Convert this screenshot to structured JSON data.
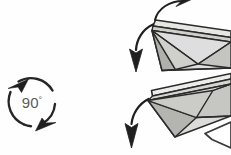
{
  "diagram": {
    "background_color": "#fefefe",
    "rotation_symbol": {
      "label": "90°",
      "degrees": 90,
      "degree_glyph": "°",
      "number": "90",
      "center_x": 32,
      "center_y": 102,
      "radius": 25,
      "stroke_color": "#262626",
      "text_color": "#5a5a5a",
      "arrow_heads": [
        {
          "name": "counterclockwise-top-arrowhead",
          "position": "top-left"
        },
        {
          "name": "counterclockwise-bottom-arrowhead",
          "position": "bottom-right"
        }
      ]
    },
    "palette": {
      "outline": "#2b2b2b",
      "facet_light": "#e8e8e6",
      "facet_mid": "#c9c9c6",
      "facet_dark": "#b2b2ae",
      "facet_white": "#fbfbfa",
      "arrow_fill": "#1f1f1f"
    },
    "upper_model": {
      "name": "upper-folded-module",
      "facet_count": 6
    },
    "lower_model": {
      "name": "lower-folded-module",
      "facet_count": 6
    },
    "arrows": [
      {
        "name": "top-curved-arrow",
        "direction": "up-right"
      },
      {
        "name": "upper-left-curved-arrow",
        "direction": "down-left"
      },
      {
        "name": "lower-left-curved-arrow",
        "direction": "down-left"
      },
      {
        "name": "bottom-right-arrowhead",
        "direction": "left"
      }
    ]
  }
}
